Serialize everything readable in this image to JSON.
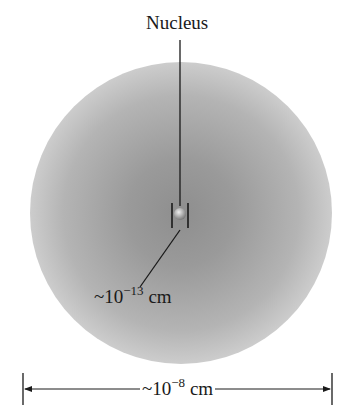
{
  "diagram": {
    "nucleus_label": "Nucleus",
    "nucleus_size_label": {
      "prefix": "~10",
      "exponent": "−13",
      "unit": " cm"
    },
    "atom_size_label": {
      "prefix": "~10",
      "exponent": "−8",
      "unit": " cm"
    },
    "colors": {
      "cloud_center": "#8e8e8e",
      "cloud_edge": "#ffffff",
      "lines": "#1a1a1a",
      "nucleus": "#b0b0b0"
    }
  }
}
